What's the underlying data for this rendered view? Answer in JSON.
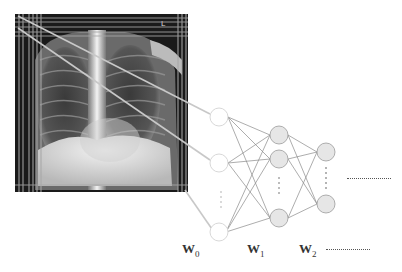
{
  "figure": {
    "image": {
      "label": "chest-xray",
      "marker": "L",
      "x": 15,
      "y": 14,
      "width": 173,
      "height": 178
    },
    "network": {
      "layers": [
        {
          "name": "input",
          "x": 219,
          "nodes_y": [
            117,
            163,
            232
          ],
          "style": "hollow",
          "ellipsis": true
        },
        {
          "name": "hidden-1",
          "x": 279,
          "nodes_y": [
            135,
            159,
            218
          ],
          "style": "filled",
          "ellipsis": true
        },
        {
          "name": "hidden-2",
          "x": 326,
          "nodes_y": [
            152,
            204
          ],
          "style": "filled",
          "ellipsis": true
        }
      ],
      "continuation": "......................",
      "node_radius": 9
    },
    "weight_labels": [
      {
        "base": "W",
        "sub": "0"
      },
      {
        "base": "W",
        "sub": "1"
      },
      {
        "base": "W",
        "sub": "2"
      }
    ],
    "weight_continuation": "......................",
    "colors": {
      "edge": "#8a8a8a",
      "node_fill": "#e6e6e6",
      "node_stroke": "#9a9a9a",
      "input_stroke": "#d8d8d8",
      "projection_line": "#c8c8c8"
    }
  }
}
